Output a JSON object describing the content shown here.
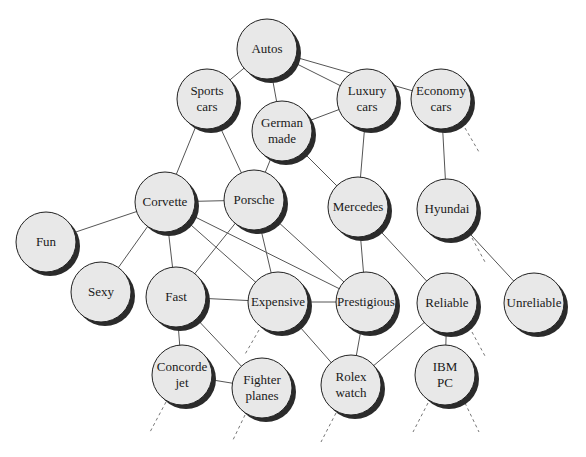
{
  "diagram": {
    "colors": {
      "node_fill": "#e8e8e8",
      "node_stroke": "#222222",
      "node_shadow": "#2b2b2b",
      "edge": "#555555",
      "dashed_edge": "#777777",
      "background": "#ffffff"
    },
    "node_radius": 30,
    "nodes": [
      {
        "id": "autos",
        "lines": [
          "Autos"
        ],
        "x": 267,
        "y": 49
      },
      {
        "id": "sports-cars",
        "lines": [
          "Sports",
          "cars"
        ],
        "x": 207,
        "y": 99
      },
      {
        "id": "luxury-cars",
        "lines": [
          "Luxury",
          "cars"
        ],
        "x": 367,
        "y": 99
      },
      {
        "id": "economy-cars",
        "lines": [
          "Economy",
          "cars"
        ],
        "x": 441,
        "y": 99
      },
      {
        "id": "german-made",
        "lines": [
          "German",
          "made"
        ],
        "x": 282,
        "y": 131
      },
      {
        "id": "corvette",
        "lines": [
          "Corvette"
        ],
        "x": 165,
        "y": 202
      },
      {
        "id": "porsche",
        "lines": [
          "Porsche"
        ],
        "x": 254,
        "y": 200
      },
      {
        "id": "mercedes",
        "lines": [
          "Mercedes"
        ],
        "x": 358,
        "y": 207
      },
      {
        "id": "hyundai",
        "lines": [
          "Hyundai"
        ],
        "x": 447,
        "y": 209
      },
      {
        "id": "fun",
        "lines": [
          "Fun"
        ],
        "x": 46,
        "y": 242
      },
      {
        "id": "sexy",
        "lines": [
          "Sexy"
        ],
        "x": 101,
        "y": 292
      },
      {
        "id": "fast",
        "lines": [
          "Fast"
        ],
        "x": 176,
        "y": 297
      },
      {
        "id": "expensive",
        "lines": [
          "Expensive"
        ],
        "x": 278,
        "y": 302
      },
      {
        "id": "prestigious",
        "lines": [
          "Prestigious"
        ],
        "x": 366,
        "y": 302
      },
      {
        "id": "reliable",
        "lines": [
          "Reliable"
        ],
        "x": 447,
        "y": 303
      },
      {
        "id": "unreliable",
        "lines": [
          "Unreliable"
        ],
        "x": 534,
        "y": 303
      },
      {
        "id": "concorde-jet",
        "lines": [
          "Concorde",
          "jet"
        ],
        "x": 182,
        "y": 375
      },
      {
        "id": "fighter-planes",
        "lines": [
          "Fighter",
          "planes"
        ],
        "x": 262,
        "y": 388
      },
      {
        "id": "rolex-watch",
        "lines": [
          "Rolex",
          "watch"
        ],
        "x": 351,
        "y": 385
      },
      {
        "id": "ibm-pc",
        "lines": [
          "IBM",
          "PC"
        ],
        "x": 445,
        "y": 375
      }
    ],
    "edges": [
      [
        "autos",
        "sports-cars"
      ],
      [
        "autos",
        "german-made"
      ],
      [
        "autos",
        "luxury-cars"
      ],
      [
        "autos",
        "economy-cars"
      ],
      [
        "luxury-cars",
        "german-made"
      ],
      [
        "luxury-cars",
        "mercedes"
      ],
      [
        "economy-cars",
        "hyundai"
      ],
      [
        "sports-cars",
        "corvette"
      ],
      [
        "sports-cars",
        "porsche"
      ],
      [
        "german-made",
        "porsche"
      ],
      [
        "german-made",
        "mercedes"
      ],
      [
        "corvette",
        "porsche"
      ],
      [
        "corvette",
        "fun"
      ],
      [
        "corvette",
        "sexy"
      ],
      [
        "corvette",
        "fast"
      ],
      [
        "corvette",
        "expensive"
      ],
      [
        "corvette",
        "prestigious"
      ],
      [
        "porsche",
        "fast"
      ],
      [
        "porsche",
        "expensive"
      ],
      [
        "porsche",
        "prestigious"
      ],
      [
        "mercedes",
        "prestigious"
      ],
      [
        "mercedes",
        "reliable"
      ],
      [
        "hyundai",
        "unreliable"
      ],
      [
        "fast",
        "expensive"
      ],
      [
        "fast",
        "concorde-jet"
      ],
      [
        "fast",
        "fighter-planes"
      ],
      [
        "expensive",
        "prestigious"
      ],
      [
        "expensive",
        "rolex-watch"
      ],
      [
        "prestigious",
        "rolex-watch"
      ],
      [
        "reliable",
        "rolex-watch"
      ],
      [
        "reliable",
        "ibm-pc"
      ],
      [
        "concorde-jet",
        "fighter-planes"
      ]
    ],
    "dangling_dashed_edges": [
      {
        "from": "economy-cars",
        "x1": 465,
        "y1": 128,
        "x2": 479,
        "y2": 152
      },
      {
        "from": "hyundai",
        "x1": 472,
        "y1": 238,
        "x2": 485,
        "y2": 262
      },
      {
        "from": "expensive",
        "x1": 259,
        "y1": 330,
        "x2": 244,
        "y2": 356
      },
      {
        "from": "reliable",
        "x1": 472,
        "y1": 332,
        "x2": 485,
        "y2": 356
      },
      {
        "from": "concorde-jet",
        "x1": 166,
        "y1": 402,
        "x2": 150,
        "y2": 432
      },
      {
        "from": "fighter-planes",
        "x1": 245,
        "y1": 415,
        "x2": 232,
        "y2": 442
      },
      {
        "from": "rolex-watch",
        "x1": 336,
        "y1": 413,
        "x2": 321,
        "y2": 442
      },
      {
        "from": "ibm-pc",
        "x1": 428,
        "y1": 403,
        "x2": 413,
        "y2": 432
      },
      {
        "from": "ibm-pc",
        "x1": 465,
        "y1": 403,
        "x2": 479,
        "y2": 432
      }
    ]
  }
}
